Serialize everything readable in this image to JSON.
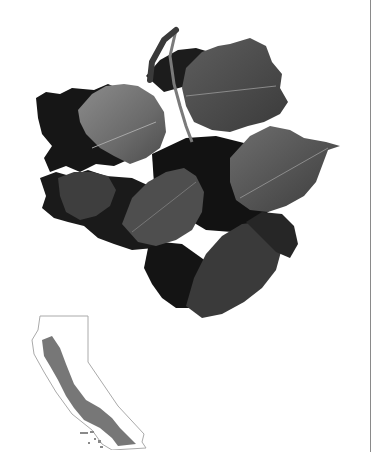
{
  "page": {
    "cropped_header_text": "",
    "figure": {
      "subject": "oak leaves photograph",
      "style": "grayscale"
    },
    "range_map": {
      "region": "California",
      "distribution": "coastal ranges",
      "colors": {
        "outline": "#aaaaaa",
        "range_fill": "#777777",
        "background": "#ffffff"
      }
    },
    "colors": {
      "rule": "#8a8a8a",
      "leaf_dark": "#151515",
      "leaf_mid": "#4a4a4a",
      "leaf_light": "#8a8a8a"
    }
  }
}
